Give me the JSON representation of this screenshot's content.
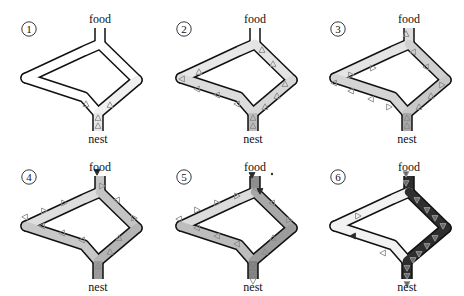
{
  "figure": {
    "labels": {
      "food": "food",
      "nest": "nest"
    },
    "colors": {
      "outline": "#111111",
      "background": "#ffffff",
      "ant": "#8a8a8a",
      "ant_dark": "#2a2a2a"
    },
    "panels": [
      {
        "id": "1",
        "number": "①",
        "offset": [
          0,
          0
        ],
        "segments": {
          "food_stem": "#ffffff",
          "left_upper": "#ffffff",
          "left_lower": "#ffffff",
          "right_upper": "#ffffff",
          "right_lower": "#f0f0f0",
          "nest_stem": "#e8e8e8"
        },
        "ants": [
          [
            98,
            126,
            "up"
          ],
          [
            98,
            118,
            "up"
          ],
          [
            86,
            104,
            "up"
          ],
          [
            110,
            105,
            "up"
          ]
        ]
      },
      {
        "id": "2",
        "number": "②",
        "offset": [
          155,
          0
        ],
        "segments": {
          "food_stem": "#ffffff",
          "left_upper": "#e8e8e8",
          "left_lower": "#dcdcdc",
          "right_upper": "#e4e4e4",
          "right_lower": "#d8d8d8",
          "nest_stem": "#bdbdbd"
        },
        "ants": [
          [
            98,
            126,
            "up"
          ],
          [
            98,
            118,
            "up"
          ],
          [
            110,
            107,
            "up"
          ],
          [
            122,
            96,
            "up"
          ],
          [
            130,
            84,
            "up"
          ],
          [
            118,
            64,
            "up"
          ],
          [
            107,
            50,
            "up"
          ],
          [
            27,
            79,
            "left"
          ],
          [
            44,
            72,
            "up"
          ],
          [
            42,
            89,
            "left"
          ],
          [
            62,
            95,
            "left"
          ],
          [
            82,
            104,
            "left"
          ]
        ]
      },
      {
        "id": "3",
        "number": "③",
        "offset": [
          309,
          0
        ],
        "segments": {
          "food_stem": "#dcdcdc",
          "left_upper": "#e4e4e4",
          "left_lower": "#d4d4d4",
          "right_upper": "#d0d0d0",
          "right_lower": "#c8c8c8",
          "nest_stem": "#a8a8a8"
        },
        "ants": [
          [
            97,
            34,
            "up"
          ],
          [
            98,
            126,
            "up"
          ],
          [
            98,
            118,
            "up"
          ],
          [
            110,
            107,
            "up"
          ],
          [
            122,
            96,
            "up"
          ],
          [
            133,
            85,
            "right"
          ],
          [
            117,
            67,
            "left"
          ],
          [
            104,
            52,
            "left"
          ],
          [
            25,
            83,
            "left"
          ],
          [
            42,
            75,
            "right"
          ],
          [
            64,
            68,
            "right"
          ],
          [
            42,
            91,
            "left"
          ],
          [
            62,
            99,
            "left"
          ],
          [
            80,
            107,
            "right"
          ]
        ]
      },
      {
        "id": "4",
        "number": "④",
        "offset": [
          0,
          148
        ],
        "segments": {
          "food_stem": "#c4c4c4",
          "left_upper": "#dedede",
          "left_lower": "#c8c8c8",
          "right_upper": "#c4c4c4",
          "right_lower": "#b4b4b4",
          "nest_stem": "#9a9a9a"
        },
        "ants": [
          [
            97,
            24,
            "down_dark"
          ],
          [
            98,
            118,
            "up"
          ],
          [
            110,
            104,
            "up"
          ],
          [
            119,
            90,
            "up"
          ],
          [
            134,
            70,
            "right"
          ],
          [
            117,
            52,
            "left"
          ],
          [
            102,
            38,
            "right"
          ],
          [
            25,
            69,
            "left"
          ],
          [
            44,
            63,
            "right"
          ],
          [
            64,
            55,
            "right"
          ],
          [
            42,
            78,
            "left"
          ],
          [
            62,
            85,
            "left"
          ],
          [
            82,
            92,
            "left"
          ]
        ]
      },
      {
        "id": "5",
        "number": "⑤",
        "offset": [
          155,
          148
        ],
        "segments": {
          "food_stem": "#8e8e8e",
          "left_upper": "#dcdcdc",
          "left_lower": "#bdbdbd",
          "right_upper": "#a8a8a8",
          "right_lower": "#9c9c9c",
          "nest_stem": "#808080"
        },
        "ants": [
          [
            97,
            27,
            "down_dark"
          ],
          [
            101,
            41,
            "left"
          ],
          [
            105,
            43,
            "down_dark"
          ],
          [
            98,
            118,
            "up"
          ],
          [
            110,
            104,
            "up"
          ],
          [
            118,
            90,
            "up"
          ],
          [
            134,
            72,
            "right"
          ],
          [
            117,
            55,
            "left"
          ],
          [
            82,
            48,
            "right"
          ],
          [
            62,
            55,
            "right"
          ],
          [
            42,
            62,
            "right"
          ],
          [
            24,
            71,
            "left"
          ],
          [
            42,
            80,
            "left"
          ],
          [
            62,
            88,
            "left"
          ],
          [
            82,
            96,
            "left"
          ],
          [
            98,
            126,
            "down"
          ],
          [
            98,
            133,
            "down"
          ]
        ],
        "stray_dot": [
          272,
          174
        ]
      },
      {
        "id": "6",
        "number": "⑥",
        "offset": [
          309,
          148
        ],
        "segments": {
          "food_stem": "#2e2e2e",
          "left_upper": "#f2f2f2",
          "left_lower": "#f2f2f2",
          "right_upper": "#2e2e2e",
          "right_lower": "#2e2e2e",
          "nest_stem": "#2e2e2e"
        },
        "ants": [
          [
            97,
            26,
            "down"
          ],
          [
            97,
            35,
            "down"
          ],
          [
            108,
            52,
            "down"
          ],
          [
            118,
            62,
            "down"
          ],
          [
            126,
            70,
            "down"
          ],
          [
            134,
            78,
            "down"
          ],
          [
            126,
            90,
            "down"
          ],
          [
            118,
            98,
            "down"
          ],
          [
            110,
            106,
            "down"
          ],
          [
            104,
            112,
            "down"
          ],
          [
            98,
            120,
            "down"
          ],
          [
            98,
            128,
            "down"
          ],
          [
            98,
            136,
            "down"
          ],
          [
            49,
            68,
            "right_light"
          ],
          [
            44,
            88,
            "left_dark"
          ],
          [
            74,
            105,
            "left_light"
          ]
        ]
      }
    ]
  }
}
